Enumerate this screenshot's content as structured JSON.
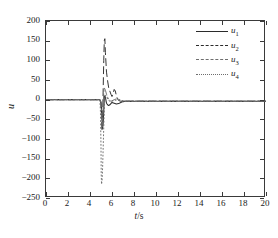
{
  "figure": {
    "background": "#ffffff",
    "frame_color": "#3a3a3a",
    "title": ""
  },
  "axes": {
    "x": {
      "label_var": "t",
      "label_unit": "/s",
      "min": 0,
      "max": 20,
      "ticks": [
        0,
        2,
        4,
        6,
        8,
        10,
        12,
        14,
        16,
        18,
        20
      ],
      "tick_labels": [
        "0",
        "2",
        "4",
        "6",
        "8",
        "10",
        "12",
        "14",
        "16",
        "18",
        "20"
      ]
    },
    "y": {
      "label": "u",
      "min": -250,
      "max": 200,
      "ticks": [
        200,
        150,
        100,
        50,
        0,
        -50,
        -100,
        -150,
        -200,
        -250
      ],
      "tick_labels": [
        "200",
        "150",
        "100",
        "50",
        "0",
        "−50",
        "−100",
        "−150",
        "−200",
        "−250"
      ]
    }
  },
  "legend": {
    "position": "top-right",
    "items": [
      {
        "key": "u1",
        "base": "u",
        "sub": "1",
        "style": "solid",
        "color": "#2b2b2b"
      },
      {
        "key": "u2",
        "base": "u",
        "sub": "2",
        "style": "dashed",
        "color": "#2b2b2b"
      },
      {
        "key": "u3",
        "base": "u",
        "sub": "3",
        "style": "dashdot",
        "color": "#6e6e6e"
      },
      {
        "key": "u4",
        "base": "u",
        "sub": "4",
        "style": "dotted",
        "color": "#6e6e6e"
      }
    ]
  },
  "chart_data": {
    "type": "line",
    "title": "",
    "xlabel": "t/s",
    "ylabel": "u",
    "xlim": [
      0,
      20
    ],
    "ylim": [
      -250,
      200
    ],
    "grid": false,
    "legend_position": "top-right",
    "series": [
      {
        "name": "u1",
        "style": "solid",
        "color": "#2b2b2b",
        "x": [
          0,
          1,
          2,
          3,
          4,
          4.6,
          4.9,
          5.0,
          5.05,
          5.1,
          5.15,
          5.2,
          5.25,
          5.3,
          5.35,
          5.4,
          5.45,
          5.5,
          5.6,
          5.7,
          5.8,
          5.9,
          6.0,
          6.2,
          6.4,
          6.6,
          6.8,
          7.0,
          7.3,
          7.6,
          8.0,
          8.5,
          9,
          10,
          11,
          12,
          13,
          14,
          15,
          16,
          17,
          18,
          19,
          20
        ],
        "y": [
          0,
          0,
          0,
          0,
          0,
          0,
          0,
          -6,
          -28,
          -55,
          -72,
          -60,
          -30,
          4,
          10,
          6,
          -2,
          -9,
          -13,
          -15,
          -13,
          -10,
          -7,
          -9,
          -11,
          -10,
          -7,
          -5,
          -4,
          -4,
          -4,
          -4,
          -4,
          -4,
          -4,
          -4,
          -4,
          -4,
          -4,
          -4,
          -4,
          -4,
          -4,
          -4
        ]
      },
      {
        "name": "u2",
        "style": "dashed",
        "color": "#2b2b2b",
        "x": [
          0,
          1,
          2,
          3,
          4,
          4.6,
          4.9,
          5.0,
          5.05,
          5.1,
          5.15,
          5.2,
          5.25,
          5.3,
          5.35,
          5.4,
          5.5,
          5.6,
          5.7,
          5.8,
          5.9,
          6.0,
          6.1,
          6.2,
          6.3,
          6.4,
          6.5,
          6.6,
          6.8,
          7.0,
          7.3,
          7.6,
          8.0,
          8.5,
          9,
          10,
          11,
          12,
          13,
          14,
          15,
          16,
          17,
          18,
          19,
          20
        ],
        "y": [
          0,
          0,
          0,
          0,
          0,
          0,
          0,
          -10,
          -45,
          -80,
          -40,
          30,
          100,
          150,
          155,
          120,
          70,
          48,
          30,
          22,
          14,
          8,
          16,
          26,
          22,
          10,
          2,
          -2,
          -4,
          -4,
          -4,
          -4,
          -4,
          -4,
          -4,
          -4,
          -4,
          -4,
          -4,
          -4,
          -4,
          -4,
          -4,
          -4,
          -4,
          -4
        ]
      },
      {
        "name": "u3",
        "style": "dashdot",
        "color": "#6e6e6e",
        "x": [
          0,
          1,
          2,
          3,
          4,
          4.6,
          4.9,
          5.0,
          5.05,
          5.1,
          5.15,
          5.2,
          5.25,
          5.3,
          5.4,
          5.5,
          5.6,
          5.7,
          5.8,
          5.9,
          6.0,
          6.2,
          6.4,
          6.6,
          6.8,
          7.0,
          7.3,
          7.6,
          8.0,
          8.5,
          9,
          10,
          11,
          12,
          13,
          14,
          15,
          16,
          17,
          18,
          19,
          20
        ],
        "y": [
          0,
          0,
          0,
          0,
          0,
          0,
          0,
          -8,
          -38,
          -70,
          -55,
          -15,
          18,
          30,
          24,
          14,
          6,
          2,
          -2,
          -4,
          -3,
          0,
          2,
          1,
          -1,
          -3,
          -4,
          -4,
          -4,
          -4,
          -4,
          -4,
          -4,
          -4,
          -4,
          -4,
          -4,
          -4,
          -4,
          -4,
          -4,
          -4
        ]
      },
      {
        "name": "u4",
        "style": "dotted",
        "color": "#6e6e6e",
        "x": [
          0,
          1,
          2,
          3,
          4,
          4.6,
          4.9,
          4.95,
          5.0,
          5.02,
          5.05,
          5.1,
          5.15,
          5.2,
          5.25,
          5.3,
          5.35,
          5.4,
          5.5,
          5.6,
          5.7,
          5.8,
          5.9,
          6.0,
          6.2,
          6.4,
          6.6,
          6.8,
          7.0,
          7.3,
          7.6,
          8.0,
          8.5,
          9,
          10,
          11,
          12,
          13,
          14,
          15,
          16,
          17,
          18,
          19,
          20
        ],
        "y": [
          0,
          0,
          0,
          0,
          0,
          0,
          0,
          -30,
          -120,
          -190,
          -215,
          -205,
          -170,
          -120,
          -70,
          -25,
          5,
          12,
          8,
          2,
          -2,
          -4,
          -5,
          -4,
          -2,
          -1,
          -2,
          -3,
          -4,
          -4,
          -4,
          -4,
          -4,
          -4,
          -4,
          -4,
          -4,
          -4,
          -4,
          -4,
          -4,
          -4,
          -4,
          -4,
          -4
        ]
      }
    ]
  }
}
